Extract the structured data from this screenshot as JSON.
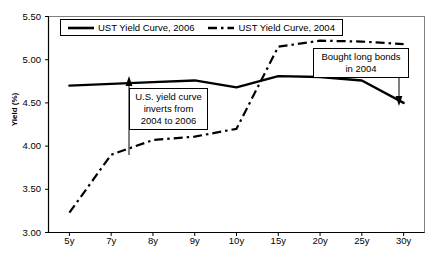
{
  "chart_data": {
    "type": "line",
    "title": "",
    "subtitle": "",
    "xlabel": "",
    "ylabel": "Yield (%)",
    "categories": [
      "5y",
      "7y",
      "8y",
      "9y",
      "10y",
      "15y",
      "20y",
      "25y",
      "30y"
    ],
    "ylim": [
      3.0,
      5.5
    ],
    "ytick_labels": [
      "5.50",
      "5.00",
      "4.50",
      "4.00",
      "3.50",
      "3.00"
    ],
    "ytick_values": [
      5.5,
      5.0,
      4.5,
      4.0,
      3.5,
      3.0
    ],
    "grid": false,
    "legend_position": "top-left-inside",
    "series": [
      {
        "name": "UST Yield Curve, 2006",
        "style": "solid",
        "color": "#000000",
        "values": [
          4.7,
          4.72,
          4.74,
          4.76,
          4.68,
          4.81,
          4.8,
          4.76,
          4.5
        ]
      },
      {
        "name": "UST Yield Curve, 2004",
        "style": "dash-dot",
        "color": "#000000",
        "values": [
          3.23,
          3.9,
          4.07,
          4.11,
          4.2,
          5.15,
          5.22,
          5.21,
          5.18
        ]
      }
    ],
    "annotations": [
      {
        "id": "invert",
        "lines": [
          "U.S. yield curve",
          "inverts from",
          "2004 to 2006"
        ],
        "arrow": "up",
        "points_to": "7y-gap-between-curves"
      },
      {
        "id": "bought",
        "lines": [
          "Bought long bonds",
          "in 2004"
        ],
        "arrow": "down",
        "points_to": "30y-2006-point"
      }
    ]
  },
  "legend": {
    "entries": [
      {
        "label": "UST Yield Curve, 2006",
        "style": "solid"
      },
      {
        "label": "UST Yield Curve, 2004",
        "style": "dash-dot"
      }
    ]
  },
  "colors": {
    "axis": "#000000",
    "plot_background": "#ffffff",
    "series_2006": "#000000",
    "series_2004": "#000000"
  }
}
